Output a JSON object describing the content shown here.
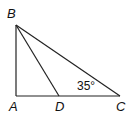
{
  "diagram": {
    "type": "geometry-triangle",
    "points": {
      "A": {
        "label": "A",
        "x": 16,
        "y": 96
      },
      "B": {
        "label": "B",
        "x": 16,
        "y": 25
      },
      "C": {
        "label": "C",
        "x": 120,
        "y": 96
      },
      "D": {
        "label": "D",
        "x": 59,
        "y": 96
      }
    },
    "segments": [
      "AB",
      "AC",
      "BC",
      "BD"
    ],
    "angle_label": {
      "vertex": "C",
      "text": "35°"
    }
  }
}
